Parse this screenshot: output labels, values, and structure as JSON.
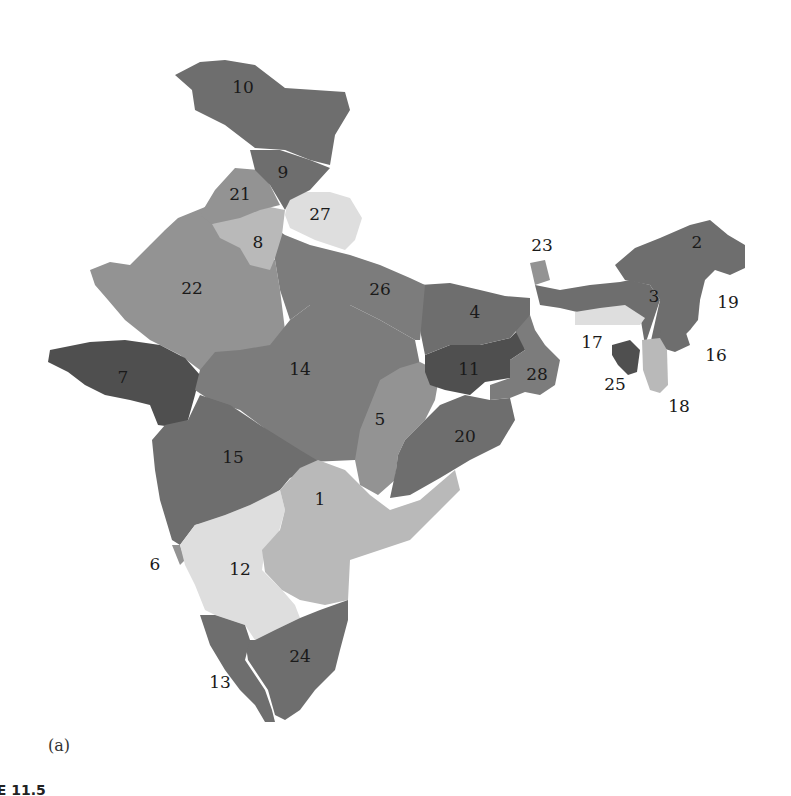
{
  "figure": {
    "panel_label": "(a)",
    "caption_fragment": "RE 11.5"
  },
  "shade_levels": {
    "darkest": "#4f4f4f",
    "dark": "#6e6e6e",
    "medium_dark": "#7c7c7c",
    "medium": "#939393",
    "light": "#b9b9b9",
    "lightest": "#dedede"
  },
  "regions": [
    {
      "id": "1",
      "shade": "light"
    },
    {
      "id": "2",
      "shade": "dark"
    },
    {
      "id": "3",
      "shade": "dark"
    },
    {
      "id": "4",
      "shade": "dark"
    },
    {
      "id": "5",
      "shade": "medium"
    },
    {
      "id": "6",
      "shade": "medium"
    },
    {
      "id": "7",
      "shade": "darkest"
    },
    {
      "id": "8",
      "shade": "light"
    },
    {
      "id": "9",
      "shade": "dark"
    },
    {
      "id": "10",
      "shade": "dark"
    },
    {
      "id": "11",
      "shade": "darkest"
    },
    {
      "id": "12",
      "shade": "lightest"
    },
    {
      "id": "13",
      "shade": "dark"
    },
    {
      "id": "14",
      "shade": "medium_dark"
    },
    {
      "id": "15",
      "shade": "dark"
    },
    {
      "id": "16",
      "shade": "dark"
    },
    {
      "id": "17",
      "shade": "lightest"
    },
    {
      "id": "18",
      "shade": "light"
    },
    {
      "id": "19",
      "shade": "dark"
    },
    {
      "id": "20",
      "shade": "dark"
    },
    {
      "id": "21",
      "shade": "medium"
    },
    {
      "id": "22",
      "shade": "medium"
    },
    {
      "id": "23",
      "shade": "medium"
    },
    {
      "id": "24",
      "shade": "dark"
    },
    {
      "id": "25",
      "shade": "darkest"
    },
    {
      "id": "26",
      "shade": "medium_dark"
    },
    {
      "id": "27",
      "shade": "lightest"
    },
    {
      "id": "28",
      "shade": "medium_dark"
    }
  ]
}
